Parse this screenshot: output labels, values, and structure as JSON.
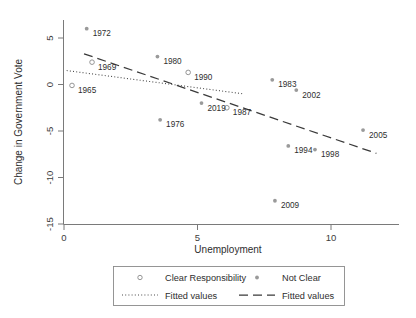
{
  "chart_data": {
    "type": "scatter",
    "title": "",
    "xlabel": "Unemployment",
    "ylabel": "Change in Government Vote",
    "xlim": [
      -0.4,
      12.2
    ],
    "ylim": [
      -16.6,
      6.9
    ],
    "xticks": [
      0,
      5,
      10
    ],
    "yticks": [
      5,
      0,
      -5,
      -10,
      -15
    ],
    "xticklabels": [
      "0",
      "5",
      "10"
    ],
    "yticklabels": [
      "5",
      "0",
      "-5",
      "-10",
      "-15"
    ],
    "grid": false,
    "legend_position": "below-axes",
    "series": [
      {
        "name": "Clear Responsibility",
        "marker": "open-circle",
        "color": "#8a8a8a",
        "points": [
          {
            "label": "1965",
            "x": 0.3,
            "y": -0.1
          },
          {
            "label": "1969",
            "x": 1.05,
            "y": 2.4
          },
          {
            "label": "1990",
            "x": 4.65,
            "y": 1.3
          },
          {
            "label": "1987",
            "x": 6.1,
            "y": -2.5
          }
        ]
      },
      {
        "name": "Not Clear",
        "marker": "filled-circle",
        "color": "#9a9a9a",
        "points": [
          {
            "label": "1972",
            "x": 0.85,
            "y": 6.0
          },
          {
            "label": "1980",
            "x": 3.5,
            "y": 3.0
          },
          {
            "label": "1976",
            "x": 3.6,
            "y": -3.8
          },
          {
            "label": "2019",
            "x": 5.15,
            "y": -2.0
          },
          {
            "label": "1983",
            "x": 7.8,
            "y": 0.5
          },
          {
            "label": "2002",
            "x": 8.7,
            "y": -0.6
          },
          {
            "label": "1994",
            "x": 8.4,
            "y": -6.6
          },
          {
            "label": "1998",
            "x": 9.4,
            "y": -7.0
          },
          {
            "label": "2009",
            "x": 7.9,
            "y": -12.5
          },
          {
            "label": "2005",
            "x": 11.2,
            "y": -4.9
          }
        ]
      }
    ],
    "fits": [
      {
        "name": "Fitted values",
        "style": "dotted",
        "for_series": "Clear Responsibility",
        "x_start": 0.1,
        "y_start": 1.5,
        "x_end": 6.7,
        "y_end": -1.0
      },
      {
        "name": "Fitted values",
        "style": "dashed",
        "for_series": "Not Clear",
        "x_start": 0.75,
        "y_start": 3.3,
        "x_end": 11.7,
        "y_end": -7.4
      }
    ],
    "legend_entries": [
      {
        "label": "Clear Responsibility",
        "symbol": "open-circle"
      },
      {
        "label": "Not Clear",
        "symbol": "filled-circle"
      },
      {
        "label": "Fitted values",
        "symbol": "dotted-line"
      },
      {
        "label": "Fitted values",
        "symbol": "dashed-line"
      }
    ]
  }
}
